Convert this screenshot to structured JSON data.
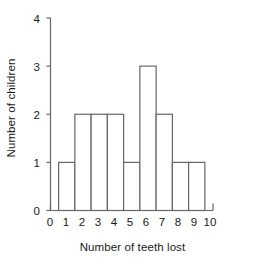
{
  "chart_data": {
    "type": "bar",
    "title": "",
    "xlabel": "Number of teeth lost",
    "ylabel": "Number of children",
    "categories": [
      "1",
      "2",
      "3",
      "4",
      "5",
      "6",
      "7",
      "8",
      "9"
    ],
    "values": [
      1,
      2,
      2,
      2,
      1,
      3,
      2,
      1,
      1
    ],
    "x": [
      1,
      2,
      3,
      4,
      5,
      6,
      7,
      8,
      9
    ],
    "bar_edges": [
      0.5,
      1.5,
      2.5,
      3.5,
      4.5,
      5.5,
      6.5,
      7.5,
      8.5,
      9.5
    ],
    "xlim": [
      0,
      10
    ],
    "ylim": [
      0,
      4
    ],
    "xticks": [
      0,
      1,
      2,
      3,
      4,
      5,
      6,
      7,
      8,
      9,
      10
    ],
    "xtick_labels": [
      "0",
      "1",
      "2",
      "3",
      "4",
      "5",
      "6",
      "7",
      "8",
      "9",
      "10"
    ],
    "yticks": [
      0,
      1,
      2,
      3,
      4
    ],
    "ytick_labels": [
      "0",
      "1",
      "2",
      "3",
      "4"
    ],
    "grid": false,
    "legend": null,
    "bar_fill": "#ffffff",
    "bar_edge_color": "#666666",
    "axis_color": "#666666",
    "text_color": "#1a1a1a",
    "background": "#ffffff"
  }
}
